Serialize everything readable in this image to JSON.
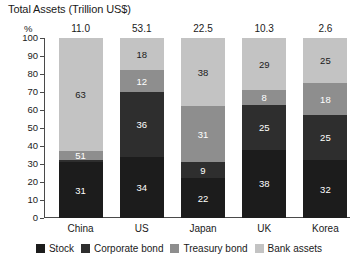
{
  "chart_data": {
    "type": "bar",
    "title": "Total Assets (Trillion US$)",
    "xlabel": "",
    "ylabel": "%",
    "ylim": [
      0,
      100
    ],
    "ytick_labels": [
      "100",
      "90",
      "80",
      "70",
      "60",
      "50",
      "40",
      "30",
      "20",
      "10",
      "0"
    ],
    "ytick_values": [
      100,
      90,
      80,
      70,
      60,
      50,
      40,
      30,
      20,
      10,
      0
    ],
    "grid": false,
    "stacked": true,
    "legend_position": "bottom",
    "categories": [
      "China",
      "US",
      "Japan",
      "UK",
      "Korea"
    ],
    "total_assets": [
      "11.0",
      "53.1",
      "22.5",
      "10.3",
      "2.6"
    ],
    "series": [
      {
        "name": "Stock",
        "color": "#1c1c1c",
        "values": [
          31,
          34,
          22,
          38,
          32
        ]
      },
      {
        "name": "Corporate bond",
        "color": "#2e2e2e",
        "values": [
          1,
          36,
          9,
          25,
          25
        ]
      },
      {
        "name": "Treasury bond",
        "color": "#8e8e8e",
        "values": [
          5,
          12,
          31,
          8,
          18
        ]
      },
      {
        "name": "Bank assets",
        "color": "#c3c3c3",
        "values": [
          63,
          18,
          38,
          29,
          25
        ]
      }
    ],
    "bars": [
      {
        "category": "China",
        "total": "11.0",
        "segments": [
          {
            "series": "Stock",
            "value": 31,
            "label": "31"
          },
          {
            "series": "Corporate bond",
            "value": 1,
            "label": ""
          },
          {
            "series": "Treasury bond",
            "value": 5,
            "label": "51"
          },
          {
            "series": "Bank assets",
            "value": 63,
            "label": "63"
          }
        ]
      },
      {
        "category": "US",
        "total": "53.1",
        "segments": [
          {
            "series": "Stock",
            "value": 34,
            "label": "34"
          },
          {
            "series": "Corporate bond",
            "value": 36,
            "label": "36"
          },
          {
            "series": "Treasury bond",
            "value": 12,
            "label": "12"
          },
          {
            "series": "Bank assets",
            "value": 18,
            "label": "18"
          }
        ]
      },
      {
        "category": "Japan",
        "total": "22.5",
        "segments": [
          {
            "series": "Stock",
            "value": 22,
            "label": "22"
          },
          {
            "series": "Corporate bond",
            "value": 9,
            "label": "9"
          },
          {
            "series": "Treasury bond",
            "value": 31,
            "label": "31"
          },
          {
            "series": "Bank assets",
            "value": 38,
            "label": "38"
          }
        ]
      },
      {
        "category": "UK",
        "total": "10.3",
        "segments": [
          {
            "series": "Stock",
            "value": 38,
            "label": "38"
          },
          {
            "series": "Corporate bond",
            "value": 25,
            "label": "25"
          },
          {
            "series": "Treasury bond",
            "value": 8,
            "label": "8"
          },
          {
            "series": "Bank assets",
            "value": 29,
            "label": "29"
          }
        ]
      },
      {
        "category": "Korea",
        "total": "2.6",
        "segments": [
          {
            "series": "Stock",
            "value": 32,
            "label": "32"
          },
          {
            "series": "Corporate bond",
            "value": 25,
            "label": "25"
          },
          {
            "series": "Treasury bond",
            "value": 18,
            "label": "18"
          },
          {
            "series": "Bank assets",
            "value": 25,
            "label": "25"
          }
        ]
      }
    ],
    "legend": [
      {
        "label": "Stock",
        "color": "#1c1c1c"
      },
      {
        "label": "Corporate bond",
        "color": "#2e2e2e"
      },
      {
        "label": "Treasury bond",
        "color": "#8e8e8e"
      },
      {
        "label": "Bank assets",
        "color": "#c3c3c3"
      }
    ]
  }
}
